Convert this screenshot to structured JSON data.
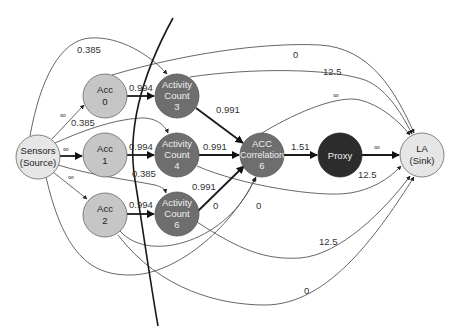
{
  "diagram": {
    "type": "flow-network-min-cut",
    "nodes": [
      {
        "id": "source",
        "lines": [
          "Sensors",
          "(Source)"
        ],
        "cx": 38,
        "cy": 157,
        "fill": "#e6e6e6",
        "text": "#222222"
      },
      {
        "id": "acc0",
        "lines": [
          "Acc",
          "0"
        ],
        "cx": 105,
        "cy": 96,
        "fill": "#c6c6c6",
        "text": "#222222"
      },
      {
        "id": "acc1",
        "lines": [
          "Acc",
          "1"
        ],
        "cx": 105,
        "cy": 155,
        "fill": "#c6c6c6",
        "text": "#222222"
      },
      {
        "id": "acc2",
        "lines": [
          "Acc",
          "2"
        ],
        "cx": 105,
        "cy": 215,
        "fill": "#c6c6c6",
        "text": "#222222"
      },
      {
        "id": "ac3",
        "lines": [
          "Activity",
          "Count",
          "3"
        ],
        "cx": 177,
        "cy": 96,
        "fill": "#6e6e6e",
        "text": "#eeeeee"
      },
      {
        "id": "ac4",
        "lines": [
          "Activity",
          "Count",
          "4"
        ],
        "cx": 177,
        "cy": 155,
        "fill": "#6e6e6e",
        "text": "#eeeeee"
      },
      {
        "id": "ac6",
        "lines": [
          "Activity",
          "Count",
          "6"
        ],
        "cx": 177,
        "cy": 214,
        "fill": "#6e6e6e",
        "text": "#eeeeee"
      },
      {
        "id": "corr",
        "lines": [
          "ACC",
          "Correlation",
          "6"
        ],
        "cx": 262,
        "cy": 155,
        "fill": "#6e6e6e",
        "text": "#eeeeee"
      },
      {
        "id": "proxy",
        "lines": [
          "Proxy"
        ],
        "cx": 340,
        "cy": 155,
        "fill": "#2c2c2c",
        "text": "#eeeeee"
      },
      {
        "id": "sink",
        "lines": [
          "LA",
          "(Sink)"
        ],
        "cx": 422,
        "cy": 155,
        "fill": "#e6e6e6",
        "text": "#222222"
      }
    ],
    "edges": [
      {
        "from": "source",
        "to": "acc0",
        "label": "∞"
      },
      {
        "from": "source",
        "to": "acc1",
        "label": "∞"
      },
      {
        "from": "source",
        "to": "acc2",
        "label": "∞"
      },
      {
        "from": "source",
        "to": "ac3",
        "label": "0.385"
      },
      {
        "from": "source",
        "to": "ac4",
        "label": "0.385"
      },
      {
        "from": "source",
        "to": "ac6",
        "label": "0.385"
      },
      {
        "from": "acc0",
        "to": "ac3",
        "label": "0.994"
      },
      {
        "from": "acc1",
        "to": "ac4",
        "label": "0.994"
      },
      {
        "from": "acc2",
        "to": "ac6",
        "label": "0.994"
      },
      {
        "from": "ac3",
        "to": "corr",
        "label": "0.991"
      },
      {
        "from": "ac4",
        "to": "corr",
        "label": "0.991"
      },
      {
        "from": "ac6",
        "to": "corr",
        "label": "0.991"
      },
      {
        "from": "corr",
        "to": "proxy",
        "label": "1.51"
      },
      {
        "from": "proxy",
        "to": "sink",
        "label": "∞"
      },
      {
        "from": "acc0",
        "to": "sink",
        "label": "0"
      },
      {
        "from": "ac3",
        "to": "sink",
        "label": "12.5"
      },
      {
        "from": "corr",
        "to": "sink",
        "label": "∞"
      },
      {
        "from": "ac4",
        "to": "sink",
        "label": "12.5"
      },
      {
        "from": "acc2",
        "to": "corr",
        "label": "0"
      },
      {
        "from": "source",
        "to": "corr",
        "label": "0"
      },
      {
        "from": "ac6",
        "to": "sink",
        "label": "12.5"
      },
      {
        "from": "acc2",
        "to": "sink",
        "label": "0"
      }
    ],
    "cut_line": {
      "description": "min-cut curve",
      "color": "#1a1a1a"
    }
  },
  "labels": {
    "e_src_acc0": "∞",
    "e_src_acc1": "∞",
    "e_src_acc2": "∞",
    "e_src_ac3": "0.385",
    "e_src_ac4": "0.385",
    "e_src_ac6": "0.385",
    "e_acc0_ac3": "0.994",
    "e_acc1_ac4": "0.994",
    "e_acc2_ac6": "0.994",
    "e_ac3_corr": "0.991",
    "e_ac4_corr": "0.991",
    "e_ac6_corr": "0.991",
    "e_corr_proxy": "1.51",
    "e_proxy_sink": "∞",
    "e_acc0_sink": "0",
    "e_ac3_sink": "12.5",
    "e_corr_sink": "∞",
    "e_ac4_sink": "12.5",
    "e_acc2_corr": "0",
    "e_src_corr": "0",
    "e_ac6_sink": "12.5",
    "e_acc2_sink": "0"
  },
  "nodes_text": {
    "source": [
      "Sensors",
      "(Source)"
    ],
    "acc0": [
      "Acc",
      "0"
    ],
    "acc1": [
      "Acc",
      "1"
    ],
    "acc2": [
      "Acc",
      "2"
    ],
    "ac3": [
      "Activity",
      "Count",
      "3"
    ],
    "ac4": [
      "Activity",
      "Count",
      "4"
    ],
    "ac6": [
      "Activity",
      "Count",
      "6"
    ],
    "corr": [
      "ACC",
      "Correlation",
      "6"
    ],
    "proxy": [
      "Proxy"
    ],
    "sink": [
      "LA",
      "(Sink)"
    ]
  }
}
